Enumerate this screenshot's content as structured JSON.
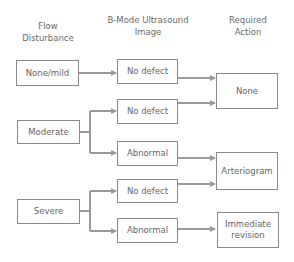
{
  "headers": {
    "col1": [
      "Flow",
      "Disturbance"
    ],
    "col2": [
      "B-Mode Ultrasound",
      "Image"
    ],
    "col3": [
      "Required",
      "Action"
    ]
  },
  "flow_disturbance": [
    {
      "label": "None/mild"
    },
    {
      "label": "Moderate"
    },
    {
      "label": "Severe"
    }
  ],
  "ultrasound": [
    {
      "label": "No defect",
      "from": "None/mild",
      "to": "None"
    },
    {
      "label": "No defect",
      "from": "Moderate",
      "to": "None"
    },
    {
      "label": "Abnormal",
      "from": "Moderate",
      "to": "Arteriogram"
    },
    {
      "label": "No defect",
      "from": "Severe",
      "to": "Arteriogram"
    },
    {
      "label": "Abnormal",
      "from": "Severe",
      "to": "Immediate revision"
    }
  ],
  "actions": [
    {
      "label": "None"
    },
    {
      "label": "Arteriogram"
    },
    {
      "label": "Immediate revision",
      "lines": [
        "Immediate",
        "revision"
      ]
    }
  ],
  "colors": {
    "arrow": "#9a9a9a",
    "border": "#8a8a8a",
    "text": "#666666"
  }
}
